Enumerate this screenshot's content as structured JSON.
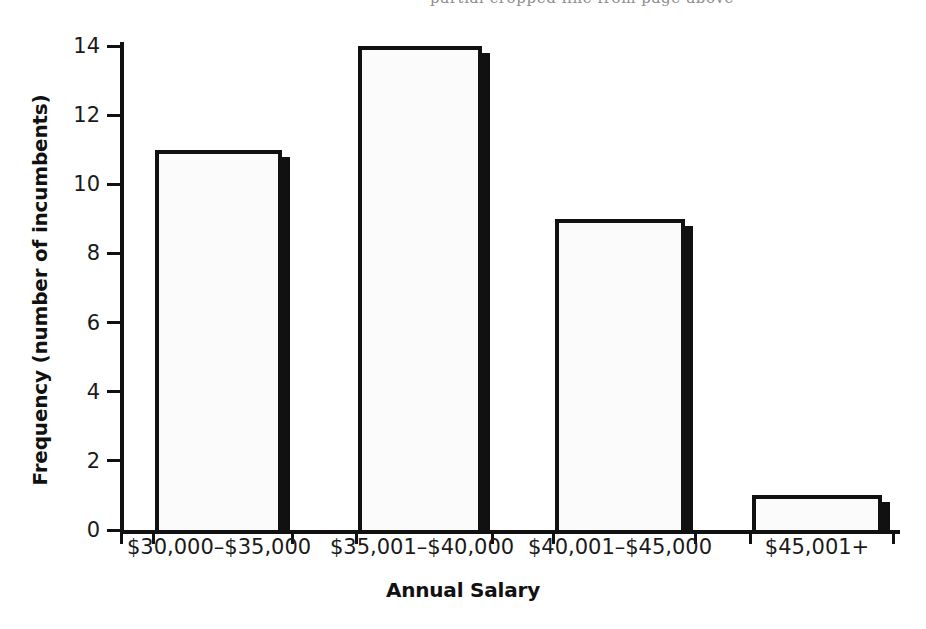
{
  "chart_data": {
    "type": "bar",
    "title": "",
    "xlabel": "Annual Salary",
    "ylabel": "Frequency (number of incumbents)",
    "categories": [
      "$30,000–$35,000",
      "$35,001–$40,000",
      "$40,001–$45,000",
      "$45,001+"
    ],
    "values": [
      11,
      14,
      9,
      1
    ],
    "series": [
      {
        "name": "Frequency",
        "values": [
          11,
          14,
          9,
          1
        ]
      }
    ],
    "ylim": [
      0,
      14
    ],
    "yticks": [
      "0",
      "2",
      "4",
      "6",
      "8",
      "10",
      "12",
      "14"
    ],
    "ytick_values": [
      0,
      2,
      4,
      6,
      8,
      10,
      12,
      14
    ],
    "grid": false,
    "legend": "none",
    "bar_style": {
      "fill": "#fbfbfb",
      "outline": "#111111",
      "shadow": "#111111"
    }
  },
  "axes": {
    "y_title": "Frequency (number of incumbents)",
    "x_title": "Annual Salary"
  },
  "bleed": {
    "text": "partial cropped line from page above"
  }
}
